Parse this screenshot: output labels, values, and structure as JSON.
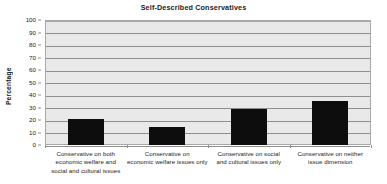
{
  "chart_data": {
    "type": "bar",
    "title": "Self-Described Conservatives",
    "xlabel": "",
    "ylabel": "Percentage",
    "ylim": [
      0,
      100
    ],
    "ytick_step": 10,
    "yticks": [
      0,
      10,
      20,
      30,
      40,
      50,
      60,
      70,
      80,
      90,
      100
    ],
    "grid": true,
    "legend": false,
    "categories": [
      "Conservative on both economic welfare and social and cultural issues",
      "Conservative on economic welfare issues only",
      "Conservative on social and cultural issues only",
      "Conservative on neither issue dimension"
    ],
    "category_lines": [
      [
        "Conservative on both",
        "economic welfare and",
        "social and cultural issues"
      ],
      [
        "Conservative on",
        "economic welfare issues only"
      ],
      [
        "Conservative on social",
        "and cultural issues only"
      ],
      [
        "Conservative on neither",
        "issue dimension"
      ]
    ],
    "values": [
      21,
      14.5,
      29,
      35.5
    ],
    "bar_color": "#0d0d0d",
    "plot_background": "#e9e9e9",
    "gridline_color": "#8f8f8f",
    "axis_color": "#a8a8a8"
  }
}
